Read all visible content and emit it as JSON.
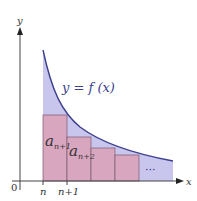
{
  "diagram": {
    "curve_label": "y = f (x)",
    "axis_labels": {
      "x": "x",
      "y": "y",
      "origin": "0"
    },
    "x_ticks": [
      "n",
      "n+1"
    ],
    "rect_labels": [
      {
        "base": "a",
        "sub": "n+1"
      },
      {
        "base": "a",
        "sub": "n+2"
      }
    ],
    "ellipsis": "···",
    "colors": {
      "area_fill": "#c9c6ee",
      "rect_fill": "#d9a6bf",
      "rect_stroke": "#7a5a6e",
      "curve": "#3c3f8c",
      "axis": "#444444",
      "label": "#3c3f8c"
    }
  }
}
